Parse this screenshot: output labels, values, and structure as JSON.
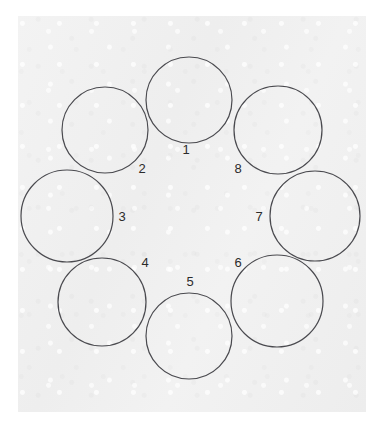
{
  "page": {
    "background_color": "#ffffff"
  },
  "panel": {
    "name": "paper-panel",
    "fill_color": "#f0f0f0",
    "x": 18,
    "y": 16,
    "width": 348,
    "height": 396
  },
  "diagram": {
    "type": "ring-of-circles",
    "circle_count": 8,
    "stroke_color": "#4a4a4f",
    "stroke_width": 1.2,
    "label_color": "#2b2b2b",
    "label_font_size": 13,
    "ring_center": {
      "x": 191,
      "y": 217
    },
    "ring_radius": 88,
    "circle_radius": 43,
    "circles": [
      {
        "label": "1",
        "cx": 189,
        "cy": 100,
        "r": 43,
        "label_x": 186,
        "label_y": 151
      },
      {
        "label": "2",
        "cx": 105,
        "cy": 130,
        "r": 43,
        "label_x": 142,
        "label_y": 170
      },
      {
        "label": "3",
        "cx": 67,
        "cy": 216,
        "r": 46,
        "label_x": 122,
        "label_y": 218
      },
      {
        "label": "4",
        "cx": 102,
        "cy": 302,
        "r": 44,
        "label_x": 145,
        "label_y": 264
      },
      {
        "label": "5",
        "cx": 189,
        "cy": 336,
        "r": 43,
        "label_x": 190,
        "label_y": 283
      },
      {
        "label": "6",
        "cx": 277,
        "cy": 301,
        "r": 46,
        "label_x": 238,
        "label_y": 264
      },
      {
        "label": "7",
        "cx": 315,
        "cy": 216,
        "r": 45,
        "label_x": 259,
        "label_y": 218
      },
      {
        "label": "8",
        "cx": 278,
        "cy": 130,
        "r": 44,
        "label_x": 238,
        "label_y": 170
      }
    ]
  }
}
